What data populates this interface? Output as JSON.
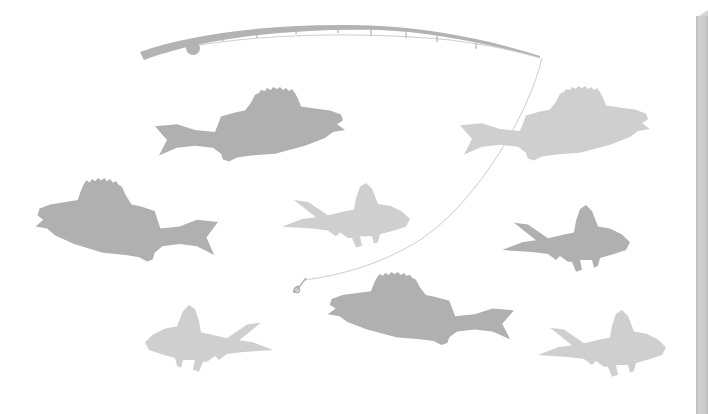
{
  "illustration": {
    "subject": "fishing rod with line and hook among fish silhouettes",
    "colors": {
      "background": "#ffffff",
      "rod": "#b3b3b3",
      "line": "#cccccc",
      "fish_dark": "#b0b0b0",
      "fish_light": "#cfcfcf",
      "side_bar": "#c8c8c8"
    },
    "rod": {
      "guide_count": 8,
      "has_reel": true
    },
    "hook": {
      "icon": "fishing-hook-icon"
    },
    "fish": [
      {
        "id": "perch-top-left",
        "kind": "perch",
        "tone": "dark",
        "facing": "right"
      },
      {
        "id": "perch-top-right",
        "kind": "perch",
        "tone": "light",
        "facing": "right"
      },
      {
        "id": "perch-middle-left",
        "kind": "perch",
        "tone": "dark",
        "facing": "left"
      },
      {
        "id": "roach-center",
        "kind": "roach",
        "tone": "light",
        "facing": "right"
      },
      {
        "id": "roach-right",
        "kind": "roach",
        "tone": "dark",
        "facing": "right"
      },
      {
        "id": "perch-bottom-center",
        "kind": "perch",
        "tone": "dark",
        "facing": "left"
      },
      {
        "id": "roach-bottom-left",
        "kind": "roach",
        "tone": "light",
        "facing": "left"
      },
      {
        "id": "roach-bottom-right",
        "kind": "roach",
        "tone": "light",
        "facing": "right"
      }
    ]
  }
}
